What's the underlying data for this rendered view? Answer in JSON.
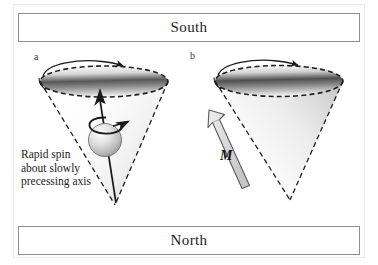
{
  "figure": {
    "title_top": "South",
    "title_bottom": "North",
    "panels": [
      {
        "letter": "a",
        "caption_lines": [
          "Rapid spin",
          "about slowly",
          "precessing axis"
        ],
        "elements": [
          "precession-cone",
          "spinning-sphere",
          "spin-axis-arrow",
          "spin-rotation-arrow",
          "precession-arrow"
        ]
      },
      {
        "letter": "b",
        "vector_label": "M",
        "elements": [
          "precession-cone",
          "magnetization-arrow",
          "precession-arrow"
        ]
      }
    ]
  },
  "colors": {
    "frame_border": "#8d8d92",
    "outer_frame": "#eceaea",
    "ink": "#1c1c1c",
    "cone_shade_dark": "#8f8f8f",
    "cone_shade_light": "#fbfbfb",
    "arrow_fill": "#d9d9d9",
    "arrow_stroke": "#4a4a4a",
    "sphere_highlight": "#f2f2f2",
    "sphere_shadow": "#9a9a9a",
    "background": "#ffffff"
  }
}
